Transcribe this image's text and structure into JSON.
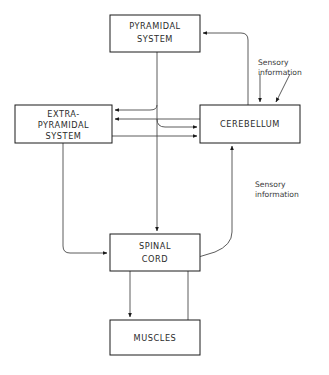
{
  "diagram": {
    "background_color": "#ffffff",
    "line_color": "#4a4a4a",
    "box_stroke_color": "#1a1a1a",
    "text_color": "#2b2b2b",
    "nodes": [
      {
        "id": "pyramidal",
        "lines": [
          "PYRAMIDAL",
          "SYSTEM"
        ],
        "x": 110,
        "y": 15,
        "w": 90,
        "h": 37
      },
      {
        "id": "extrapyramidal",
        "lines": [
          "EXTRA-",
          "PYRAMIDAL",
          "SYSTEM"
        ],
        "x": 15,
        "y": 105,
        "w": 97,
        "h": 38
      },
      {
        "id": "cerebellum",
        "lines": [
          "CEREBELLUM"
        ],
        "x": 200,
        "y": 105,
        "w": 100,
        "h": 38
      },
      {
        "id": "spinalcord",
        "lines": [
          "SPINAL",
          "CORD"
        ],
        "x": 110,
        "y": 234,
        "w": 90,
        "h": 37
      },
      {
        "id": "muscles",
        "lines": [
          "MUSCLES"
        ],
        "x": 110,
        "y": 320,
        "w": 90,
        "h": 35
      }
    ],
    "annotations": [
      {
        "id": "sensory-top",
        "lines": [
          "Sensory",
          "information"
        ],
        "x": 258,
        "y": 63
      },
      {
        "id": "sensory-middle",
        "lines": [
          "Sensory",
          "information"
        ],
        "x": 255,
        "y": 185
      }
    ],
    "edges": [
      {
        "id": "cerebellum-to-pyramidal",
        "from": "cerebellum",
        "to": "pyramidal",
        "arrow": true
      },
      {
        "id": "pyramidal-to-extrapyramidal",
        "from": "pyramidal",
        "to": "extrapyramidal",
        "arrow": true
      },
      {
        "id": "cerebellum-to-extrapyramidal",
        "from": "cerebellum",
        "to": "extrapyramidal",
        "arrow": true
      },
      {
        "id": "pyramidal-to-cerebellum",
        "from": "pyramidal",
        "to": "cerebellum",
        "arrow": true
      },
      {
        "id": "extrapyramidal-to-cerebellum",
        "from": "extrapyramidal",
        "to": "cerebellum",
        "arrow": true
      },
      {
        "id": "pyramidal-to-spinalcord",
        "from": "pyramidal",
        "to": "spinalcord",
        "arrow": true
      },
      {
        "id": "extrapyramidal-to-spinalcord",
        "from": "extrapyramidal",
        "to": "spinalcord",
        "arrow": true
      },
      {
        "id": "spinalcord-to-cerebellum",
        "from": "spinalcord",
        "to": "cerebellum",
        "arrow": true
      },
      {
        "id": "spinalcord-to-muscles",
        "from": "spinalcord",
        "to": "muscles",
        "arrow": true
      },
      {
        "id": "muscles-to-spinalcord",
        "from": "muscles",
        "to": "spinalcord",
        "arrow": true
      },
      {
        "id": "sensory-input-left",
        "from": "external",
        "to": "cerebellum",
        "arrow": true
      },
      {
        "id": "sensory-input-right",
        "from": "external",
        "to": "cerebellum",
        "arrow": true
      }
    ]
  }
}
